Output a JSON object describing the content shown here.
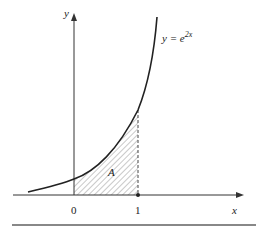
{
  "figure": {
    "y_axis_label": "y",
    "x_axis_label": "x",
    "curve_label_lhs": "y = e",
    "curve_label_exp": "2x",
    "region_label": "A",
    "tick_labels": [
      "0",
      "1"
    ],
    "colors": {
      "line": "#222222",
      "hatch": "#777777",
      "rule": "#888888"
    }
  }
}
